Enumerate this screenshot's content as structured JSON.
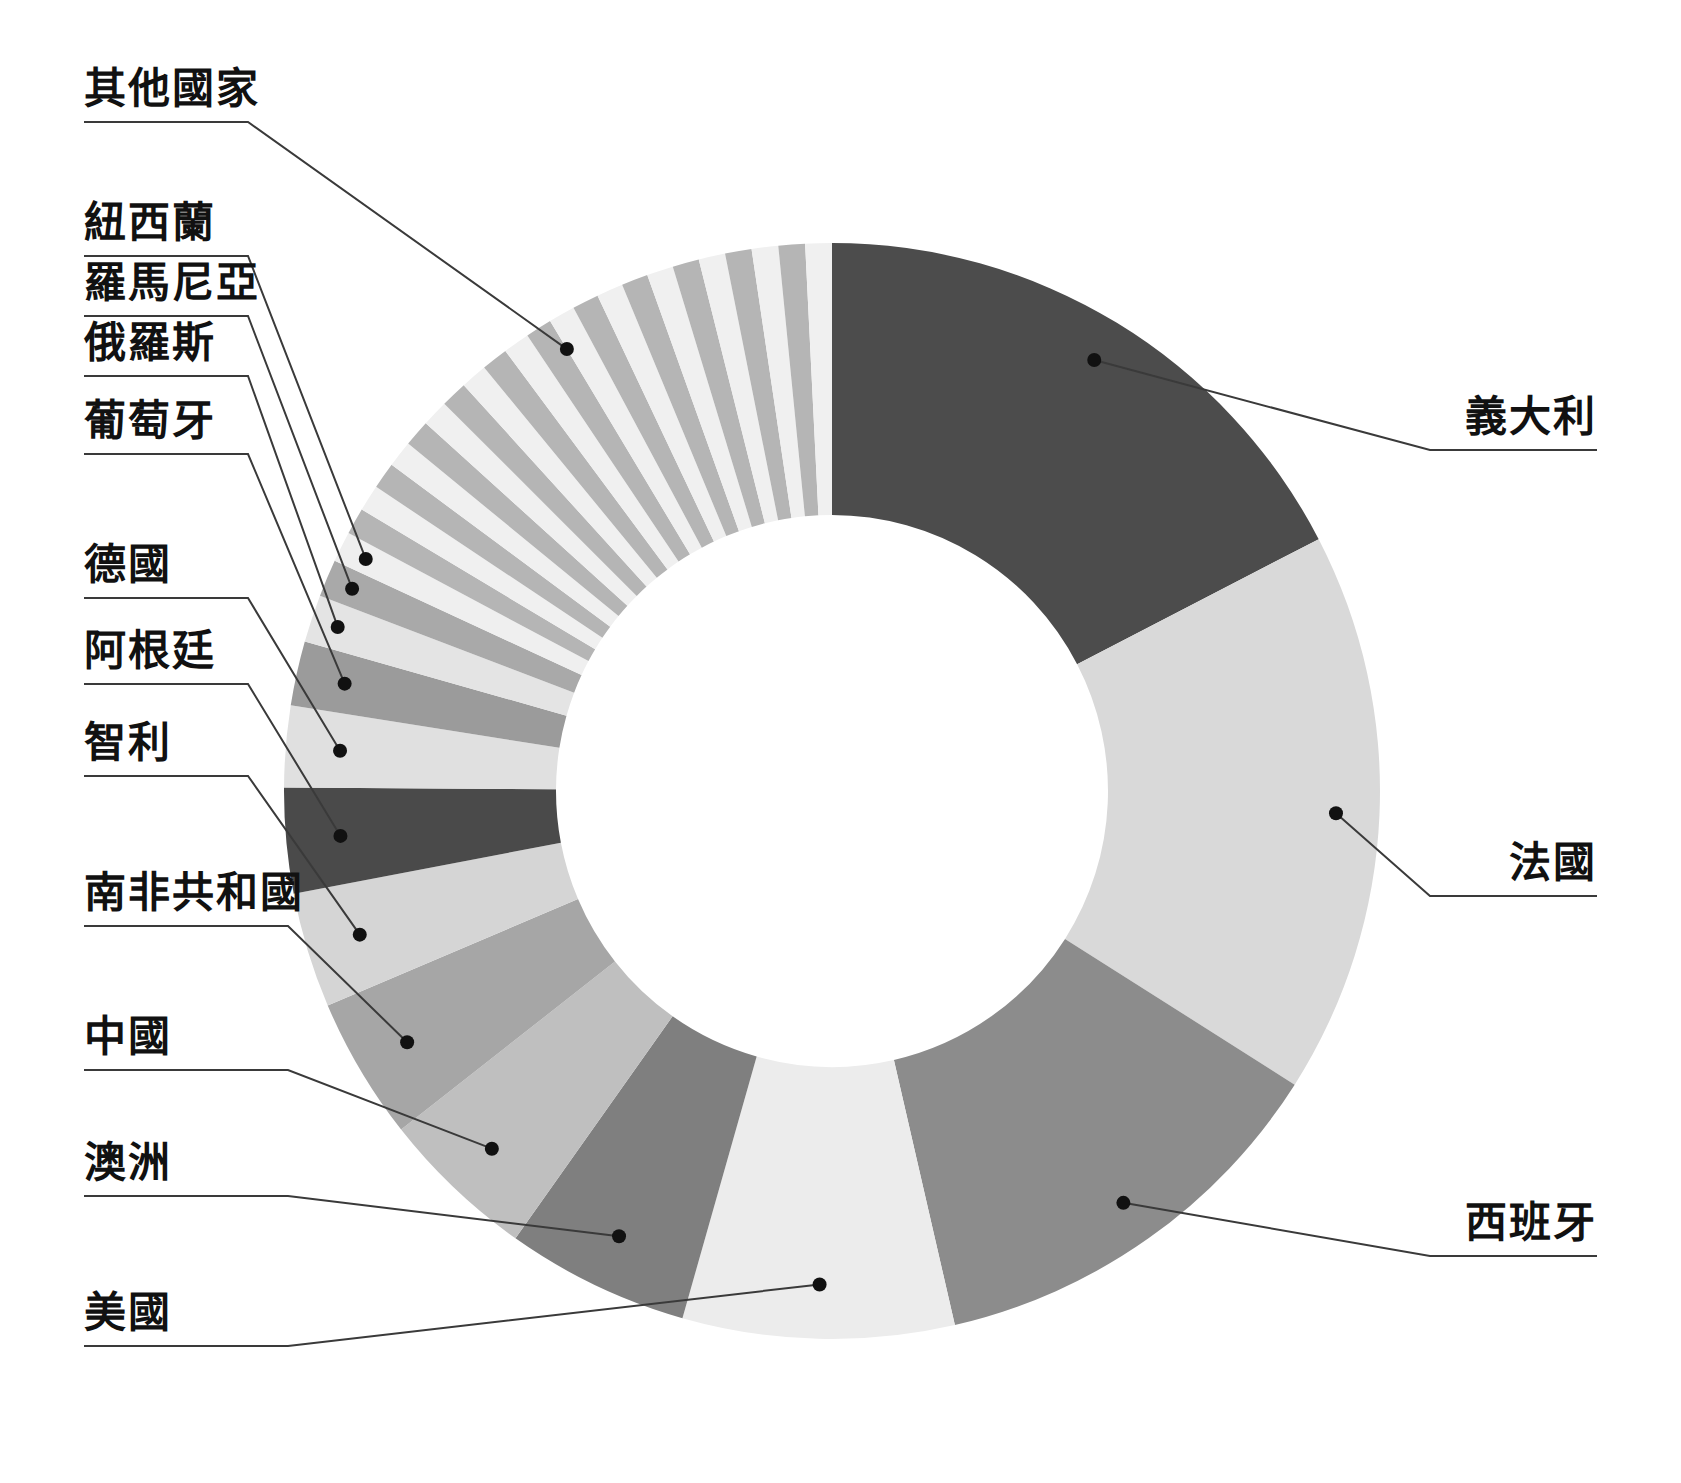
{
  "chart_data": {
    "type": "pie",
    "variant": "donut",
    "title": "",
    "subtitle": "",
    "xlabel": "",
    "ylabel": "",
    "legend_position": "none",
    "grid": false,
    "labels_outside": true,
    "leader_lines": true,
    "start_angle_deg": 0,
    "direction": "clockwise",
    "inner_radius_ratio": 0.5,
    "categories": [
      "義大利",
      "法國",
      "西班牙",
      "美國",
      "澳洲",
      "中國",
      "南非共和國",
      "智利",
      "阿根廷",
      "德國",
      "葡萄牙",
      "俄羅斯",
      "羅馬尼亞",
      "紐西蘭",
      "其他國家"
    ],
    "values": [
      17.4,
      16.6,
      12.4,
      8.0,
      5.4,
      4.6,
      4.2,
      3.4,
      3.1,
      2.4,
      1.9,
      1.4,
      1.1,
      0.9,
      17.2
    ],
    "unit": "%",
    "colors": [
      "#4c4c4c",
      "#d9d9d9",
      "#8c8c8c",
      "#ececec",
      "#7f7f7f",
      "#bfbfbf",
      "#a6a6a6",
      "#d5d5d5",
      "#4a4a4a",
      "#e0e0e0",
      "#9b9b9b",
      "#e4e4e4",
      "#a9a9a9",
      "#efefef",
      "#cfcfcf"
    ],
    "other_slices": {
      "note": "其他國家 is drawn as many thin alternating slices",
      "count": 22,
      "alternating_colors": [
        "#b5b5b5",
        "#f0f0f0"
      ]
    }
  },
  "labels": [
    {
      "key": "other",
      "text": "其他國家",
      "side": "left"
    },
    {
      "key": "new_zealand",
      "text": "紐西蘭",
      "side": "left"
    },
    {
      "key": "romania",
      "text": "羅馬尼亞",
      "side": "left"
    },
    {
      "key": "russia",
      "text": "俄羅斯",
      "side": "left"
    },
    {
      "key": "portugal",
      "text": "葡萄牙",
      "side": "left"
    },
    {
      "key": "germany",
      "text": "德國",
      "side": "left"
    },
    {
      "key": "argentina",
      "text": "阿根廷",
      "side": "left"
    },
    {
      "key": "chile",
      "text": "智利",
      "side": "left"
    },
    {
      "key": "south_africa",
      "text": "南非共和國",
      "side": "left"
    },
    {
      "key": "china",
      "text": "中國",
      "side": "left"
    },
    {
      "key": "australia",
      "text": "澳洲",
      "side": "left"
    },
    {
      "key": "usa",
      "text": "美國",
      "side": "left"
    },
    {
      "key": "italy",
      "text": "義大利",
      "side": "right"
    },
    {
      "key": "france",
      "text": "法國",
      "side": "right"
    },
    {
      "key": "spain",
      "text": "西班牙",
      "side": "right"
    }
  ],
  "colors": {
    "background": "#ffffff",
    "text": "#111111",
    "leader_line": "#3a3a3a",
    "hole": "#ffffff"
  }
}
